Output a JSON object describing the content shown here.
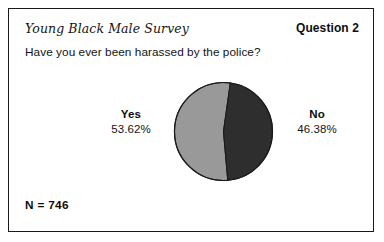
{
  "card": {
    "survey_title": "Young Black Male Survey",
    "question_number": "Question 2",
    "question_text": "Have you ever been harassed by the police?",
    "sample_size": "N = 746"
  },
  "chart_data": {
    "type": "pie",
    "title": "Have you ever been harassed by the police?",
    "categories": [
      "Yes",
      "No"
    ],
    "values": [
      53.62,
      46.38
    ],
    "value_labels": [
      "53.62%",
      "46.38%"
    ],
    "units": "percent",
    "sample_size": 746,
    "legend": "callouts",
    "start_angle_deg": 8,
    "direction": "counterclockwise",
    "slices": [
      {
        "label": "Yes",
        "value": 53.62,
        "value_label": "53.62%",
        "color": "#999999",
        "callout_side": "left"
      },
      {
        "label": "No",
        "value": 46.38,
        "value_label": "46.38%",
        "color": "#2e2e2e",
        "callout_side": "right"
      }
    ],
    "outline_color": "#1a1a1a",
    "grid": false
  }
}
